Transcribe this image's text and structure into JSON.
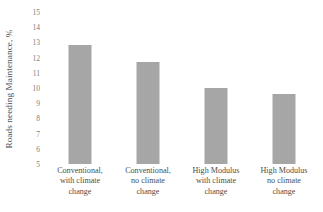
{
  "chart_data": {
    "type": "bar",
    "title": "",
    "subtitle": "",
    "xlabel": "",
    "ylabel": "Roads needing Maintenance, %",
    "categories": [
      "Conventional, with climate change",
      "Conventional, no climate change",
      "High Modulus with climate change",
      "High Modulus no climate change"
    ],
    "category_lines": [
      [
        "Conventional,",
        "with climate",
        "change"
      ],
      [
        "Conventional,",
        "no climate",
        "change"
      ],
      [
        "High Modulus",
        "with climate",
        "change"
      ],
      [
        "High Modulus",
        "no climate",
        "change"
      ]
    ],
    "values": [
      12.8,
      11.7,
      10.0,
      9.6
    ],
    "ylim": [
      5,
      15
    ],
    "ytick_step": 1,
    "ytick_labels": [
      "15",
      "14",
      "13",
      "12",
      "11",
      "10",
      "9",
      "8",
      "7",
      "6",
      "5"
    ],
    "grid": false,
    "legend": false,
    "legend_position": "none",
    "bar_color": "#a6a6a6",
    "background_color": "#ffffff",
    "axis_text_color": "#7f7f7f"
  }
}
